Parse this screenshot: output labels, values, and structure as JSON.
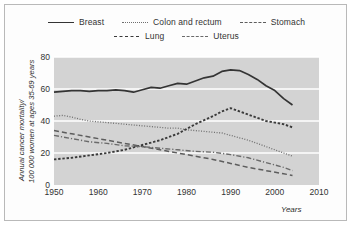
{
  "chart_data": {
    "type": "line",
    "title": "",
    "xlabel": "Years",
    "ylabel": "Annual cancer mortality/ 100 000 women at ages 35-69 years",
    "ylabel_line1": "Annual cancer mortality/",
    "ylabel_line2": "100 000 women at ages 35-69 years",
    "xlim": [
      1950,
      2010
    ],
    "ylim": [
      0,
      80
    ],
    "xticks": [
      "1950",
      "1960",
      "1970",
      "1980",
      "1990",
      "2000",
      "2010"
    ],
    "yticks": [
      "0",
      "20",
      "40",
      "60",
      "80"
    ],
    "grid": "horizontal-white",
    "legend_position": "top",
    "plot_background": "#d3d3d3",
    "series": [
      {
        "name": "Breast",
        "style": "solid",
        "color": "#343434",
        "x": [
          1950,
          1952,
          1954,
          1956,
          1958,
          1960,
          1962,
          1964,
          1966,
          1968,
          1970,
          1972,
          1974,
          1976,
          1978,
          1980,
          1982,
          1984,
          1986,
          1988,
          1990,
          1992,
          1994,
          1996,
          1998,
          2000,
          2002,
          2004
        ],
        "values": [
          58,
          58.5,
          59,
          59,
          58.5,
          59,
          59,
          59.5,
          59,
          58,
          59.5,
          61,
          60.5,
          62,
          63.5,
          63,
          65,
          67,
          68,
          71,
          72,
          71.5,
          69,
          66,
          62,
          59,
          54,
          50
        ]
      },
      {
        "name": "Colon and rectum",
        "style": "dotted",
        "color": "#6e6e6e",
        "x": [
          1950,
          1952,
          1954,
          1956,
          1958,
          1960,
          1962,
          1964,
          1966,
          1968,
          1970,
          1972,
          1974,
          1976,
          1978,
          1980,
          1982,
          1984,
          1986,
          1988,
          1990,
          1992,
          1994,
          1996,
          1998,
          2000,
          2002,
          2004
        ],
        "values": [
          43,
          43.5,
          42.5,
          41,
          40,
          39.5,
          39,
          38.5,
          38,
          37.5,
          37,
          36.5,
          36,
          35.5,
          35.5,
          34.5,
          34,
          33.5,
          33,
          32.5,
          31,
          29.5,
          28,
          26,
          24,
          22,
          20,
          18
        ]
      },
      {
        "name": "Stomach",
        "style": "dash-long",
        "color": "#5d5d5d",
        "x": [
          1950,
          1954,
          1958,
          1962,
          1966,
          1970,
          1974,
          1978,
          1982,
          1986,
          1990,
          1994,
          1998,
          2002,
          2004
        ],
        "values": [
          34,
          32,
          30,
          28,
          26,
          24,
          22,
          20,
          18,
          16,
          13.5,
          11,
          9,
          7,
          6
        ]
      },
      {
        "name": "Lung",
        "style": "dash-short",
        "color": "#3a3a3a",
        "x": [
          1950,
          1954,
          1958,
          1962,
          1966,
          1970,
          1974,
          1978,
          1982,
          1986,
          1988,
          1990,
          1992,
          1994,
          1996,
          1998,
          2000,
          2002,
          2004
        ],
        "values": [
          16,
          17,
          18.5,
          20,
          22,
          25,
          28,
          32,
          38,
          43,
          46,
          48,
          46,
          44,
          42,
          40,
          39,
          38,
          36
        ]
      },
      {
        "name": "Uterus",
        "style": "dash-dot",
        "color": "#6a6a6a",
        "x": [
          1950,
          1954,
          1958,
          1962,
          1966,
          1970,
          1974,
          1978,
          1982,
          1986,
          1990,
          1994,
          1998,
          2002,
          2004
        ],
        "values": [
          31,
          29,
          27,
          26,
          24.5,
          24,
          23,
          22,
          21,
          20.5,
          19,
          17,
          14,
          11,
          9
        ]
      }
    ],
    "legend": [
      {
        "label": "Breast",
        "style": "solid"
      },
      {
        "label": "Colon and rectum",
        "style": "dotted"
      },
      {
        "label": "Stomach",
        "style": "dash-long"
      },
      {
        "label": "Lung",
        "style": "dash-short"
      },
      {
        "label": "Uterus",
        "style": "dash-dot"
      }
    ]
  }
}
